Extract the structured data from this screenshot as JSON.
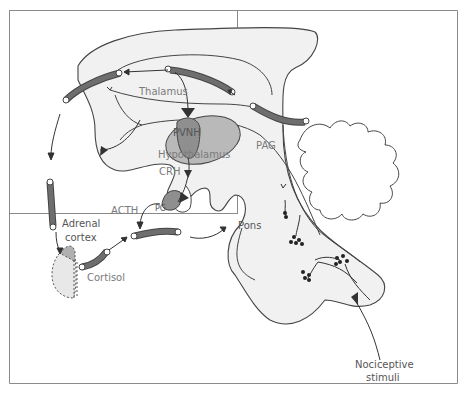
{
  "diagram": {
    "title": "",
    "type": "anatomical-pathway",
    "colors": {
      "border": "#8a8a8a",
      "brain_fill": "#f1f1f1",
      "outline": "#444444",
      "hypothalamus_fill": "#b9b9b9",
      "pvnh_fill": "#8f8f8f",
      "pathway_tube": "#6e6e6e",
      "label_gray": "#7a7a7a",
      "label_dark": "#555555",
      "arrow": "#333333"
    },
    "labels": {
      "thalamus": "Thalamus",
      "pvnh": "PVNH",
      "hypothalamus": "Hypothalamus",
      "crh": "CRH",
      "acth": "ACTH",
      "pg": "PG",
      "pag": "PAG",
      "pons": "Pons",
      "adrenal_line1": "Adrenal",
      "adrenal_line2": "cortex",
      "cortisol": "Cortisol",
      "nociceptive_line1": "Nociceptive",
      "nociceptive_line2": "stimuli"
    },
    "nodes": [
      {
        "id": "nociceptive-stimuli",
        "label": "Nociceptive stimuli"
      },
      {
        "id": "pons",
        "label": "Pons"
      },
      {
        "id": "pag",
        "label": "PAG"
      },
      {
        "id": "thalamus",
        "label": "Thalamus"
      },
      {
        "id": "pvnh",
        "label": "PVNH"
      },
      {
        "id": "hypothalamus",
        "label": "Hypothalamus"
      },
      {
        "id": "crh",
        "label": "CRH"
      },
      {
        "id": "pg",
        "label": "PG"
      },
      {
        "id": "acth",
        "label": "ACTH"
      },
      {
        "id": "adrenal-cortex",
        "label": "Adrenal cortex"
      },
      {
        "id": "cortisol",
        "label": "Cortisol"
      }
    ],
    "edges": [
      {
        "from": "nociceptive-stimuli",
        "to": "pons"
      },
      {
        "from": "pons",
        "to": "pag"
      },
      {
        "from": "pag",
        "to": "thalamus"
      },
      {
        "from": "thalamus",
        "to": "pvnh"
      },
      {
        "from": "pvnh",
        "to": "crh"
      },
      {
        "from": "crh",
        "to": "pg"
      },
      {
        "from": "pg",
        "to": "acth"
      },
      {
        "from": "acth",
        "to": "adrenal-cortex"
      },
      {
        "from": "adrenal-cortex",
        "to": "cortisol"
      },
      {
        "from": "cortisol",
        "to": "brain"
      }
    ]
  }
}
